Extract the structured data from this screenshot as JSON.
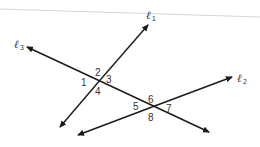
{
  "diagram": {
    "title": "",
    "lines": [
      {
        "name": "l1",
        "label": "ℓ",
        "subscript": "1"
      },
      {
        "name": "l2",
        "label": "ℓ",
        "subscript": "2"
      },
      {
        "name": "l3",
        "label": "ℓ",
        "subscript": "3"
      }
    ],
    "angles": [
      "1",
      "2",
      "3",
      "4",
      "5",
      "6",
      "7",
      "8"
    ],
    "colors": {
      "line": "#1a1a1a",
      "text": "#333333",
      "rule": "#cfcfcf"
    }
  }
}
